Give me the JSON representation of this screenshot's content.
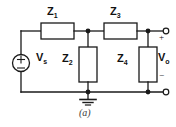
{
  "figure": {
    "caption": "(a)",
    "type": "circuit-schematic"
  },
  "labels": {
    "z1": "Z",
    "z1_sub": "1",
    "z2": "Z",
    "z2_sub": "2",
    "z3": "Z",
    "z3_sub": "3",
    "z4": "Z",
    "z4_sub": "4",
    "vs": "V",
    "vs_sub": "s",
    "vo": "V",
    "vo_sub": "o"
  },
  "polarity": {
    "source_plus": "+",
    "source_minus": "−",
    "output_plus": "+",
    "output_minus": "−"
  },
  "components": {
    "source": {
      "name": "independent-voltage-source",
      "symbol": "circle-with-plus-minus"
    },
    "series_impedances": [
      "Z1",
      "Z3"
    ],
    "shunt_impedances": [
      "Z2",
      "Z4"
    ],
    "ground": {
      "name": "earth-ground",
      "symbol": "three-bar-ground"
    },
    "terminals": {
      "top": "open-circle",
      "bottom": "open-circle",
      "count": 2
    },
    "nodes": {
      "junction_dots": 4
    }
  },
  "colors": {
    "background": "#ffffff",
    "wire": "#1a1a1a",
    "text": "#111111",
    "caption": "#3a3a3a",
    "component_fill": "#ffffff"
  }
}
